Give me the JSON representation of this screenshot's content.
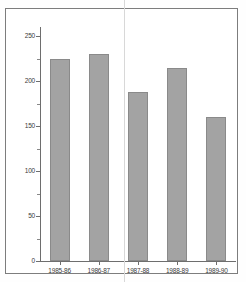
{
  "chart_data": {
    "type": "bar",
    "title": "",
    "subtitle": "",
    "xlabel": "",
    "ylabel": "",
    "categories": [
      "1985-86",
      "1986-87",
      "1987-88",
      "1988-89",
      "1989-90"
    ],
    "values": [
      225,
      230,
      188,
      214,
      160
    ],
    "series": [
      {
        "name": "",
        "values": [
          225,
          230,
          188,
          214,
          160
        ]
      }
    ],
    "ylim": [
      0,
      260
    ],
    "yticks": [
      0,
      50,
      100,
      150,
      200,
      250
    ],
    "ytick_labels": [
      "0",
      "50",
      "100",
      "150",
      "200",
      "250"
    ],
    "yminor_ticks": [
      25,
      75,
      125,
      175,
      225
    ],
    "grid": false,
    "legend": null,
    "legend_position": "none",
    "bar_color": "#a3a3a3",
    "bar_edge_color": "#8a8a8a",
    "axis_color": "#6e6e6e",
    "background_color": "#ffffff"
  },
  "figure": {
    "frame_color": "#7d7d7d",
    "fold_line_color": "#d8d8d8"
  }
}
